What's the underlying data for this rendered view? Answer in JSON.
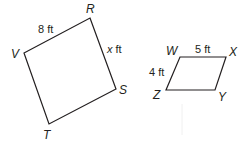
{
  "figures": [
    {
      "name": "quadrilateral RSTV",
      "vertices": {
        "R": {
          "label": "R",
          "x": 90,
          "y": 18
        },
        "S": {
          "label": "S",
          "x": 116,
          "y": 89
        },
        "T": {
          "label": "T",
          "x": 49,
          "y": 124
        },
        "V": {
          "label": "V",
          "x": 24,
          "y": 53
        }
      },
      "sides": {
        "VR": {
          "value": "8",
          "unit": "ft",
          "text": "8 ft"
        },
        "RS": {
          "variable": "x",
          "unit": "ft",
          "text": "ft"
        }
      }
    },
    {
      "name": "parallelogram WXYZ",
      "vertices": {
        "W": {
          "label": "W",
          "x": 180,
          "y": 57
        },
        "X": {
          "label": "X",
          "x": 226,
          "y": 57
        },
        "Y": {
          "label": "Y",
          "x": 215,
          "y": 90
        },
        "Z": {
          "label": "Z",
          "x": 166,
          "y": 90
        }
      },
      "sides": {
        "WX": {
          "value": "5",
          "unit": "ft",
          "text": "5 ft"
        },
        "WZ": {
          "value": "4",
          "unit": "ft",
          "text": "4 ft"
        }
      }
    }
  ],
  "colors": {
    "stroke": "#231f20",
    "background": "#ffffff"
  }
}
